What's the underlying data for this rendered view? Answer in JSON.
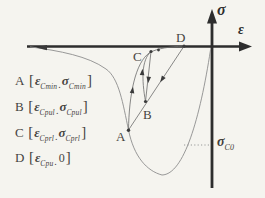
{
  "diagram": {
    "axes": {
      "y_label": "σ",
      "x_label": "ε"
    },
    "points": {
      "a": "A",
      "b": "B",
      "c": "C",
      "d": "D"
    },
    "sigma_c0": {
      "main": "σ",
      "sub": "C0"
    },
    "legend": [
      {
        "letter": "A",
        "open": "[",
        "eps": "ε",
        "eps_sub": "Cmin",
        "sep": ".",
        "second": "σ",
        "second_sub": "Cmin",
        "close": "]"
      },
      {
        "letter": "B",
        "open": "[",
        "eps": "ε",
        "eps_sub": "Cpul",
        "sep": ".",
        "second": "σ",
        "second_sub": "Cpul",
        "close": "]"
      },
      {
        "letter": "C",
        "open": "[",
        "eps": "ε",
        "eps_sub": "Cprl",
        "sep": ".",
        "second": "σ",
        "second_sub": "Cprl",
        "close": "]"
      },
      {
        "letter": "D",
        "open": "[",
        "eps": "ε",
        "eps_sub": "Cpu",
        "sep": ".",
        "second": "0",
        "second_sub": "",
        "close": "]"
      }
    ],
    "colors": {
      "background": "#f5f4ef",
      "axis": "#2d2d2d",
      "envelope_curve": "#8d8d8d",
      "loop_lines": "#6b6b6b",
      "text": "#45433f"
    }
  }
}
